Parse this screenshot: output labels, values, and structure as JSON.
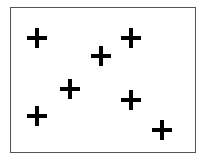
{
  "canvas": {
    "width": 201,
    "height": 158,
    "background": "#ffffff"
  },
  "frame": {
    "x": 10,
    "y": 7,
    "width": 186,
    "height": 146,
    "border_color": "#555555"
  },
  "marker": {
    "shape": "plus-icon",
    "color": "#000000",
    "size": 20,
    "stroke": 4
  },
  "markers": [
    {
      "x": 37,
      "y": 38
    },
    {
      "x": 101,
      "y": 56
    },
    {
      "x": 131,
      "y": 38
    },
    {
      "x": 70,
      "y": 89
    },
    {
      "x": 37,
      "y": 116
    },
    {
      "x": 131,
      "y": 100
    },
    {
      "x": 162,
      "y": 130
    }
  ]
}
